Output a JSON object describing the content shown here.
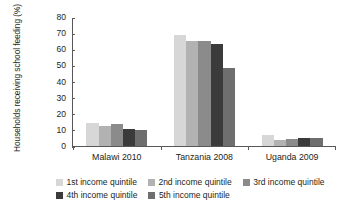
{
  "chart_data": {
    "type": "bar",
    "title": "",
    "subtitle": "",
    "xlabel": "",
    "ylabel": "Households receiving school feeding (%)",
    "categories": [
      "Malawi 2010",
      "Tanzania 2008",
      "Uganda 2009"
    ],
    "ylim": [
      0,
      80
    ],
    "yticks": [
      0,
      10,
      20,
      30,
      40,
      50,
      60,
      70,
      80
    ],
    "ytick_labels": [
      "0",
      "10",
      "20",
      "30",
      "40",
      "50",
      "60",
      "70",
      "80"
    ],
    "grid": false,
    "legend_position": "bottom",
    "series": [
      {
        "name": "1st income quintile",
        "color": "#d7d7d7",
        "values": [
          14.6,
          69.6,
          6.7
        ]
      },
      {
        "name": "2nd income quintile",
        "color": "#b2b2b2",
        "values": [
          12.5,
          65.8,
          4.0
        ]
      },
      {
        "name": "3rd income quintile",
        "color": "#8b8b8b",
        "values": [
          13.7,
          65.9,
          4.5
        ]
      },
      {
        "name": "4th income quintile",
        "color": "#3b3b3b",
        "values": [
          10.8,
          63.8,
          5.0
        ]
      },
      {
        "name": "5th income quintile",
        "color": "#6e6e6e",
        "values": [
          10.0,
          48.9,
          4.7
        ]
      }
    ]
  },
  "axis": {
    "tick_80": "80",
    "tick_70": "70",
    "tick_60": "60",
    "tick_50": "50",
    "tick_40": "40",
    "tick_30": "30",
    "tick_20": "20",
    "tick_10": "10",
    "tick_0": "0",
    "ylabel": "Households receiving school feeding (%)",
    "cat_0": "Malawi 2010",
    "cat_1": "Tanzania 2008",
    "cat_2": "Uganda 2009"
  },
  "legend": {
    "items": [
      {
        "label": "1st income quintile",
        "color": "#d7d7d7"
      },
      {
        "label": "2nd income quintile",
        "color": "#b2b2b2"
      },
      {
        "label": "3rd income quintile",
        "color": "#8b8b8b"
      },
      {
        "label": "4th income quintile",
        "color": "#3b3b3b"
      },
      {
        "label": "5th income quintile",
        "color": "#6e6e6e"
      }
    ]
  }
}
